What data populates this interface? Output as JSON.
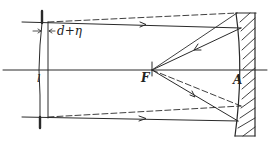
{
  "diagram": {
    "type": "optical ray diagram (Schmidt camera / corrector plate with concave mirror)",
    "labels": {
      "thickness": "d+η",
      "plate": "l",
      "focus": "F",
      "vertex": "A"
    },
    "elements": [
      "corrector plate",
      "optical axis",
      "incident rays with arrows",
      "dashed marginal rays",
      "reflected rays converging to focus F",
      "concave spherical mirror with hatching"
    ],
    "colors": {
      "ink": "#2a2a2a",
      "background": "#ffffff"
    }
  }
}
